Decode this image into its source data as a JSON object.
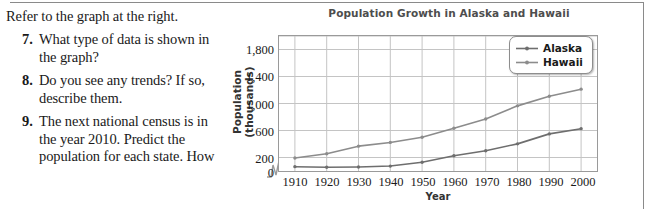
{
  "worksheet": {
    "intro": "Refer to the graph at the right.",
    "questions": [
      {
        "number": "7.",
        "text": "What type of data is shown in the graph?"
      },
      {
        "number": "8.",
        "text": "Do you see any trends? If so, describe them."
      },
      {
        "number": "9.",
        "text": "The next national census is in the year 2010. Predict the population for each state. How"
      }
    ]
  },
  "chart_data": {
    "type": "line",
    "title": "Population Growth in Alaska and Hawaii",
    "xlabel": "Year",
    "ylabel": "Population (thousands)",
    "x": [
      1910,
      1920,
      1930,
      1940,
      1950,
      1960,
      1970,
      1980,
      1990,
      2000
    ],
    "xticklabels": [
      "1910",
      "1920",
      "1930",
      "1940",
      "1950",
      "1960",
      "1970",
      "1980",
      "1990",
      "2000"
    ],
    "yticks": [
      0,
      200,
      600,
      1000,
      1400,
      1800
    ],
    "yticklabels": [
      "0",
      "200",
      "600",
      "1,000",
      "1,400",
      "1,800"
    ],
    "ylim": [
      0,
      2000
    ],
    "xlim": [
      1905,
      2005
    ],
    "grid": true,
    "axis_break": true,
    "legend_position": "top-right",
    "series": [
      {
        "name": "Alaska",
        "color": "#6e6e6e",
        "values": [
          64,
          55,
          59,
          73,
          129,
          226,
          300,
          402,
          550,
          627
        ]
      },
      {
        "name": "Hawaii",
        "color": "#8c8c8c",
        "values": [
          192,
          256,
          368,
          423,
          500,
          633,
          770,
          965,
          1108,
          1212
        ]
      }
    ]
  },
  "legend": {
    "entries": [
      {
        "label": "Alaska"
      },
      {
        "label": "Hawaii"
      }
    ]
  },
  "colors": {
    "line_alaska": "#6e6e6e",
    "line_hawaii": "#8c8c8c",
    "grid": "#c4c4c4",
    "axis": "#9a9a9a",
    "title": "#4d4d4d"
  }
}
